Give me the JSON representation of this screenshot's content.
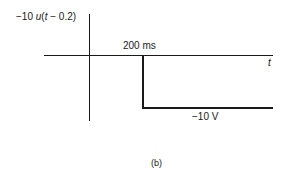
{
  "figure": {
    "function_label_prefix": "−10 ",
    "function_label_u": "u",
    "function_label_paren_open": "(",
    "function_label_t": "t",
    "function_label_rest": " − 0.2)",
    "time_marker": "200 ms",
    "axis_label": "t",
    "level_label": "−10 V",
    "caption": "(b)"
  }
}
